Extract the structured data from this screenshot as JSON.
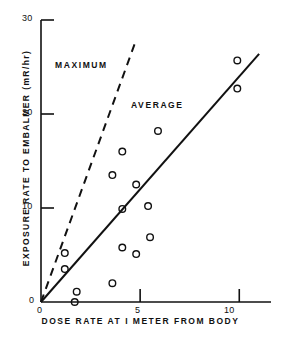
{
  "chart_data": {
    "type": "scatter",
    "title": "",
    "xlabel": "DOSE RATE AT I METER FROM BODY",
    "ylabel": "EXPOSURE RATE TO EMBALMER (mR/hr)",
    "xlim": [
      0,
      11.6
    ],
    "ylim": [
      0,
      30
    ],
    "xticks": [
      0,
      5,
      10
    ],
    "xtick_labels": [
      "0",
      "5",
      "10"
    ],
    "yticks": [
      0,
      10,
      20,
      30
    ],
    "ytick_labels": [
      "0",
      "10",
      "20",
      "30"
    ],
    "grid": false,
    "legend_position": "inline-annotations",
    "marker": "open-circle",
    "points": [
      {
        "x": 1.2,
        "y": 5.2
      },
      {
        "x": 1.2,
        "y": 3.5
      },
      {
        "x": 1.8,
        "y": 1.1
      },
      {
        "x": 1.7,
        "y": 0.0
      },
      {
        "x": 3.6,
        "y": 2.0
      },
      {
        "x": 3.6,
        "y": 13.5
      },
      {
        "x": 4.1,
        "y": 16.0
      },
      {
        "x": 4.1,
        "y": 9.9
      },
      {
        "x": 4.1,
        "y": 5.8
      },
      {
        "x": 4.8,
        "y": 12.5
      },
      {
        "x": 4.8,
        "y": 5.1
      },
      {
        "x": 5.4,
        "y": 10.2
      },
      {
        "x": 5.5,
        "y": 6.9
      },
      {
        "x": 5.9,
        "y": 18.2
      },
      {
        "x": 9.9,
        "y": 25.7
      },
      {
        "x": 9.9,
        "y": 22.7
      }
    ],
    "series": [
      {
        "name": "MAXIMUM",
        "type": "line",
        "style": "dashed",
        "slope": 5.6,
        "line": [
          {
            "x": 0,
            "y": 0
          },
          {
            "x": 4.75,
            "y": 27.6
          }
        ],
        "label_x": 1.1,
        "label_y": 23.6
      },
      {
        "name": "AVERAGE",
        "type": "line",
        "style": "solid",
        "slope": 2.38,
        "line": [
          {
            "x": 0,
            "y": 0
          },
          {
            "x": 11.0,
            "y": 26.4
          }
        ],
        "label_x": 4.6,
        "label_y": 20.6
      }
    ]
  },
  "axes": {
    "x_title": "DOSE RATE AT I METER FROM BODY",
    "y_title": "EXPOSURE RATE TO EMBALMER (mR/hr)",
    "x_tick_labels": [
      "0",
      "5",
      "10"
    ],
    "y_tick_labels": [
      "0",
      "10",
      "20",
      "30"
    ]
  },
  "annotations": {
    "maximum_label": "MAXIMUM",
    "average_label": "AVERAGE"
  },
  "colors": {
    "ink": "#111111",
    "background": "#ffffff"
  }
}
